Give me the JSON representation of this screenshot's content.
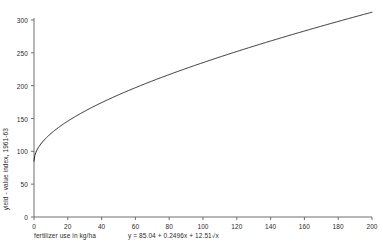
{
  "chart_data": {
    "type": "line",
    "title": "",
    "subtitle": "",
    "xlabel": "fertilizer use in kg/ha",
    "ylabel": "yield - value index, 1961-63",
    "annotation": "y = 85.04 + 0.2496x + 12.51√x",
    "equation": {
      "intercept": 85.04,
      "linear_coefficient": 0.2496,
      "sqrt_coefficient": 12.51
    },
    "xlim": [
      0,
      200
    ],
    "ylim": [
      0,
      300
    ],
    "xticks": [
      0,
      20,
      40,
      60,
      80,
      100,
      120,
      140,
      160,
      180,
      200
    ],
    "yticks": [
      0,
      50,
      100,
      150,
      200,
      250,
      300
    ],
    "grid": false,
    "legend": "none",
    "line_color": "#2b2b2b",
    "axis_color": "#6e6e6e",
    "background_color": "#ffffff",
    "series": [
      {
        "name": "fitted yield-value curve",
        "x": [
          0,
          2,
          4,
          6,
          8,
          10,
          15,
          20,
          25,
          30,
          35,
          40,
          45,
          50,
          60,
          70,
          80,
          90,
          100,
          110,
          120,
          130,
          140,
          150,
          160,
          170,
          180,
          190,
          200
        ],
        "y": [
          85.0,
          103.2,
          110.1,
          115.2,
          119.4,
          123.1,
          131.1,
          137.9,
          143.9,
          149.0,
          155.0,
          160.1,
          164.9,
          185.0,
          193.4,
          201.2,
          214.9,
          226.2,
          235.1,
          244.7,
          252.0,
          260.1,
          268.0,
          275.2,
          282.1,
          288.6,
          294.9,
          301.0,
          311.9
        ]
      }
    ],
    "curve_endpoints": {
      "x_start": 0,
      "y_start": 85.04,
      "x_end": 200,
      "y_end": 311.9
    }
  }
}
